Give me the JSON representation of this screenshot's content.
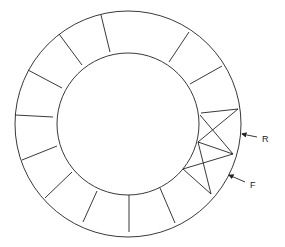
{
  "diagram": {
    "center": [
      128,
      124
    ],
    "outer_radius": 113,
    "inner_radius": 71,
    "spokes": [
      [
        101,
        15,
        110,
        52
      ],
      [
        59,
        34,
        82,
        65
      ],
      [
        28,
        70,
        62,
        88
      ],
      [
        15,
        115,
        53,
        117
      ],
      [
        22,
        160,
        57,
        146
      ],
      [
        45,
        198,
        72,
        172
      ],
      [
        83,
        222,
        97,
        191
      ],
      [
        129,
        232,
        129,
        195
      ],
      [
        175,
        223,
        160,
        188
      ],
      [
        189,
        32,
        169,
        62
      ],
      [
        222,
        66,
        190,
        84
      ]
    ],
    "truss_lines": [
      [
        238,
        109,
        201,
        113
      ],
      [
        238,
        109,
        198,
        142
      ],
      [
        233,
        154,
        200,
        115
      ],
      [
        233,
        154,
        198,
        142
      ],
      [
        233,
        154,
        183,
        169
      ],
      [
        211,
        194,
        198,
        142
      ],
      [
        211,
        194,
        183,
        169
      ]
    ],
    "labels": [
      {
        "id": "R",
        "text": "R",
        "x": 262,
        "y": 142,
        "arrow": [
          257,
          137,
          242,
          134
        ]
      },
      {
        "id": "F",
        "text": "F",
        "x": 250,
        "y": 188,
        "arrow": [
          245,
          182,
          229,
          175
        ]
      }
    ],
    "stroke_color": "#222222"
  }
}
